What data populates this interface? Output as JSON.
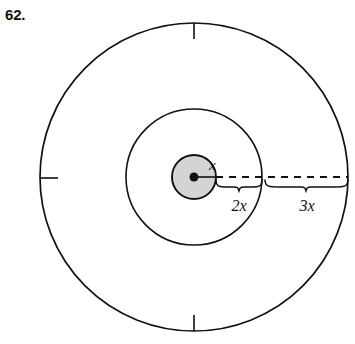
{
  "figure": {
    "problem_number": "62.",
    "center_dot": {
      "cx": 194,
      "cy": 177,
      "r": 4.5
    },
    "circles": [
      {
        "name": "inner-circle",
        "cx": 194,
        "cy": 177,
        "r": 22,
        "fill": "#d4d4d4",
        "stroke": "#111111",
        "stroke_width": 1.9
      },
      {
        "name": "middle-circle",
        "cx": 194,
        "cy": 177,
        "r": 68,
        "fill": "none",
        "stroke": "#111111",
        "stroke_width": 1.6
      },
      {
        "name": "outer-circle",
        "cx": 194,
        "cy": 177,
        "r": 154,
        "fill": "none",
        "stroke": "#111111",
        "stroke_width": 1.7
      }
    ],
    "radius_line_solid": {
      "x1": 194,
      "y1": 177,
      "x2": 216,
      "y2": 177
    },
    "radius_line_dashed": {
      "x1": 216,
      "y1": 177,
      "x2": 348,
      "y2": 177,
      "dash": "7 6"
    },
    "ticks": [
      {
        "name": "tick-top",
        "x1": 194,
        "y1": 23,
        "x2": 194,
        "y2": 39
      },
      {
        "name": "tick-left",
        "x1": 40,
        "y1": 178,
        "x2": 58,
        "y2": 178
      },
      {
        "name": "tick-bottom",
        "x1": 194,
        "y1": 315,
        "x2": 194,
        "y2": 331
      }
    ],
    "braces": [
      {
        "name": "brace-2x",
        "x_start": 216,
        "x_end": 262,
        "y": 186,
        "depth": 8
      },
      {
        "name": "brace-3x",
        "x_start": 265,
        "x_end": 348,
        "y": 186,
        "depth": 8
      }
    ],
    "labels": {
      "center_radius": {
        "text": "x",
        "x": 209,
        "y": 170
      },
      "segment_two": {
        "text": "2x",
        "x": 239,
        "y": 211
      },
      "segment_three": {
        "text": "3x",
        "x": 307,
        "y": 211
      }
    }
  },
  "colors": {
    "ink": "#111111",
    "inner_fill": "#d4d4d4",
    "background": "#ffffff"
  }
}
